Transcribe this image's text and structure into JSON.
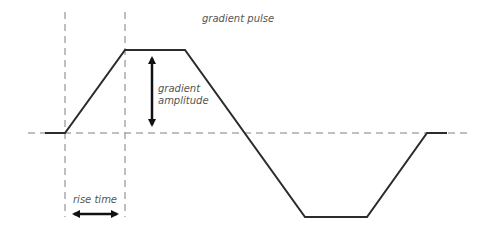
{
  "diagram": {
    "title": "gradient pulse",
    "labels": {
      "amplitude_line1": "gradient",
      "amplitude_line2": "amplitude",
      "rise_time": "rise time"
    },
    "colors": {
      "waveform": "#2b2b2b",
      "guide": "#aaaaaa",
      "arrow": "#111111",
      "text": "#555555"
    },
    "waveform_points": [
      [
        45,
        133
      ],
      [
        65,
        133
      ],
      [
        125,
        50
      ],
      [
        185,
        50
      ],
      [
        305,
        217
      ],
      [
        367,
        217
      ],
      [
        427,
        133
      ],
      [
        447,
        133
      ]
    ],
    "baseline": {
      "y": 133,
      "x1": 28,
      "x2": 472
    },
    "guides": [
      {
        "x": 65,
        "y1": 12,
        "y2": 217
      },
      {
        "x": 125,
        "y1": 12,
        "y2": 217
      }
    ],
    "amplitude_arrow": {
      "x": 152,
      "y1": 52,
      "y2": 131
    },
    "rise_time_arrow": {
      "y": 214,
      "x1": 68,
      "x2": 123
    }
  }
}
